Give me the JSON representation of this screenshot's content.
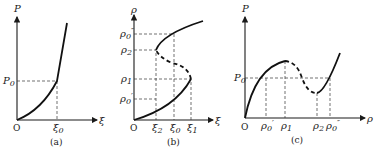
{
  "figure": {
    "panels": [
      {
        "id": "a",
        "caption": "(a)",
        "y_axis_label": "P",
        "x_axis_label": "ξ",
        "origin_label": "O",
        "y_ticks": [
          "P0"
        ],
        "x_ticks": [
          "ξ0"
        ],
        "description": "P vs ξ: convex curve from origin with a kink at (ξ0, P0), then steeper rise"
      },
      {
        "id": "b",
        "caption": "(b)",
        "y_axis_label": "ρ",
        "x_axis_label": "ξ",
        "origin_label": "O",
        "y_ticks": [
          "ρ0''",
          "ρ2",
          "ρ1",
          "ρ0'"
        ],
        "x_ticks": [
          "ξ2",
          "ξ0",
          "ξ1"
        ],
        "description": "ρ vs ξ: S-shaped curve; solid lower branch up to turning point (ξ1, ρ1), dashed unstable middle branch back to (ξ2, ρ2), solid upper branch"
      },
      {
        "id": "c",
        "caption": "(c)",
        "y_axis_label": "P",
        "x_axis_label": "ρ",
        "origin_label": "O",
        "y_ticks": [
          "P0"
        ],
        "x_ticks": [
          "ρ0'",
          "ρ1",
          "ρ2",
          "ρ0''"
        ],
        "description": "P vs ρ: van der Waals-like curve; rises to max at ρ1, dashed decreasing segment to min at ρ2, then rises; P0 line intersects at ρ0' and ρ0''"
      }
    ]
  },
  "labels": {
    "a": {
      "P": "P",
      "P0": "P",
      "P0_sub": "0",
      "O": "O",
      "xi": "ξ",
      "xi0": "ξ",
      "xi0_sub": "0",
      "cap": "(a)"
    },
    "b": {
      "rho": "ρ",
      "r0pp": "ρ",
      "r0pp_sub": "0",
      "r0pp_sup": "″",
      "r2": "ρ",
      "r2_sub": "2",
      "r1": "ρ",
      "r1_sub": "1",
      "r0p": "ρ",
      "r0p_sub": "0",
      "r0p_sup": "′",
      "O": "O",
      "xi": "ξ",
      "xi2": "ξ",
      "xi2_sub": "2",
      "xi0": "ξ",
      "xi0_sub": "0",
      "xi1": "ξ",
      "xi1_sub": "1",
      "cap": "(b)"
    },
    "c": {
      "P": "P",
      "P0": "P",
      "P0_sub": "0",
      "O": "O",
      "rho": "ρ",
      "r0p": "ρ",
      "r0p_sub": "0",
      "r0p_sup": "′",
      "r1": "ρ",
      "r1_sub": "1",
      "r2": "ρ",
      "r2_sub": "2",
      "r0pp": "ρ",
      "r0pp_sub": "0",
      "r0pp_sup": "″",
      "cap": "(c)"
    }
  }
}
